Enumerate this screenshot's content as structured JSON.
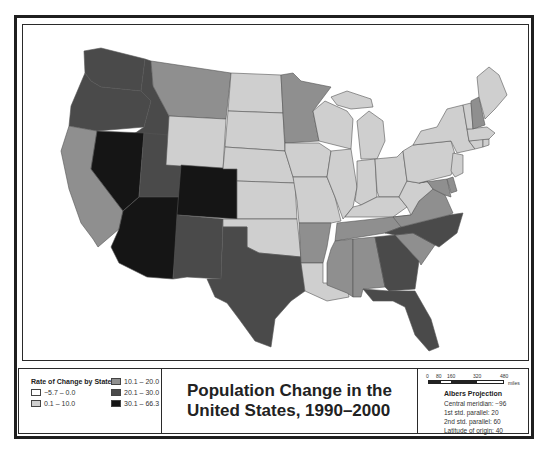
{
  "map": {
    "title_line1": "Population Change in the",
    "title_line2": "United States, 1990–2000",
    "colors": {
      "class1": "#ffffff",
      "class2": "#cfcfcf",
      "class3": "#8f8f8f",
      "class4": "#4a4a4a",
      "class5": "#151515",
      "border": "#555555"
    }
  },
  "legend": {
    "title": "Rate of Change by State",
    "items": [
      {
        "label": "−5.7 – 0.0",
        "color": "#ffffff"
      },
      {
        "label": "0.1 – 10.0",
        "color": "#cfcfcf"
      },
      {
        "label": "10.1 – 20.0",
        "color": "#8f8f8f"
      },
      {
        "label": "20.1 – 30.0",
        "color": "#4a4a4a"
      },
      {
        "label": "30.1 – 66.3",
        "color": "#151515"
      }
    ]
  },
  "scale": {
    "ticks": [
      "0",
      "80",
      "160",
      "320",
      "480"
    ],
    "unit": "miles"
  },
  "projection": {
    "title": "Albers Projection",
    "lines": [
      "Central meridian: −96",
      "1st std. parallel: 20",
      "2nd std. parallel: 60",
      "Latitude of origin: 40"
    ]
  },
  "states": [
    {
      "name": "Washington",
      "class": 4
    },
    {
      "name": "Oregon",
      "class": 4
    },
    {
      "name": "California",
      "class": 3
    },
    {
      "name": "Idaho",
      "class": 4
    },
    {
      "name": "Nevada",
      "class": 5
    },
    {
      "name": "Utah",
      "class": 4
    },
    {
      "name": "Arizona",
      "class": 5
    },
    {
      "name": "Montana",
      "class": 3
    },
    {
      "name": "Wyoming",
      "class": 2
    },
    {
      "name": "Colorado",
      "class": 5
    },
    {
      "name": "New Mexico",
      "class": 4
    },
    {
      "name": "North Dakota",
      "class": 2
    },
    {
      "name": "South Dakota",
      "class": 2
    },
    {
      "name": "Nebraska",
      "class": 2
    },
    {
      "name": "Kansas",
      "class": 2
    },
    {
      "name": "Oklahoma",
      "class": 2
    },
    {
      "name": "Texas",
      "class": 4
    },
    {
      "name": "Minnesota",
      "class": 3
    },
    {
      "name": "Iowa",
      "class": 2
    },
    {
      "name": "Missouri",
      "class": 2
    },
    {
      "name": "Arkansas",
      "class": 3
    },
    {
      "name": "Louisiana",
      "class": 2
    },
    {
      "name": "Wisconsin",
      "class": 2
    },
    {
      "name": "Illinois",
      "class": 2
    },
    {
      "name": "Michigan",
      "class": 2
    },
    {
      "name": "Indiana",
      "class": 2
    },
    {
      "name": "Ohio",
      "class": 2
    },
    {
      "name": "Kentucky",
      "class": 2
    },
    {
      "name": "Tennessee",
      "class": 3
    },
    {
      "name": "Mississippi",
      "class": 3
    },
    {
      "name": "Alabama",
      "class": 3
    },
    {
      "name": "Georgia",
      "class": 4
    },
    {
      "name": "Florida",
      "class": 4
    },
    {
      "name": "South Carolina",
      "class": 3
    },
    {
      "name": "North Carolina",
      "class": 4
    },
    {
      "name": "Virginia",
      "class": 3
    },
    {
      "name": "West Virginia",
      "class": 2
    },
    {
      "name": "Maryland",
      "class": 3
    },
    {
      "name": "Delaware",
      "class": 3
    },
    {
      "name": "Pennsylvania",
      "class": 2
    },
    {
      "name": "New York",
      "class": 2
    },
    {
      "name": "New Jersey",
      "class": 2
    },
    {
      "name": "Connecticut",
      "class": 2
    },
    {
      "name": "Rhode Island",
      "class": 2
    },
    {
      "name": "Massachusetts",
      "class": 2
    },
    {
      "name": "Vermont",
      "class": 2
    },
    {
      "name": "New Hampshire",
      "class": 3
    },
    {
      "name": "Maine",
      "class": 2
    }
  ]
}
